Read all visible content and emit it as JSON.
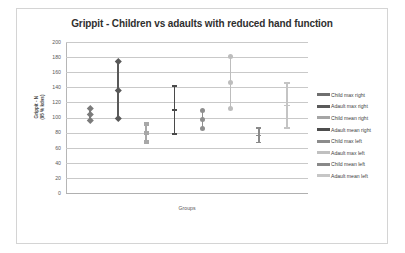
{
  "chart": {
    "title": "Grippit - Children vs adaults with reduced hand function",
    "xlabel": "Groups",
    "ylabel_line1": "Grippit - N",
    "ylabel_line2": "(95 % kdvs)"
  },
  "chart_data": {
    "type": "scatter",
    "title": "Grippit - Children vs adaults with reduced hand function",
    "xlabel": "Groups",
    "ylabel": "Grippit - N (95 % kdvs)",
    "ylim": [
      0,
      200
    ],
    "ytick_labels": [
      "0",
      "20",
      "40",
      "60",
      "80",
      "100",
      "120",
      "140",
      "160",
      "180",
      "200"
    ],
    "ytick_values": [
      0,
      20,
      40,
      60,
      80,
      100,
      120,
      140,
      160,
      180,
      200
    ],
    "grid": true,
    "legend_position": "right",
    "series": [
      {
        "name": "Child max right",
        "color": "#7b7b7b",
        "marker": "diamond",
        "x": 1,
        "mean": 104,
        "low": 96,
        "high": 112
      },
      {
        "name": "Adault max right",
        "color": "#595959",
        "marker": "triangle",
        "x": 2,
        "mean": 136,
        "low": 99,
        "high": 175
      },
      {
        "name": "Child mean right",
        "color": "#a8a8a8",
        "marker": "square",
        "x": 3,
        "mean": 80,
        "low": 68,
        "high": 91
      },
      {
        "name": "Adault mean right",
        "color": "#4a4a4a",
        "marker": "cross",
        "x": 4,
        "mean": 110,
        "low": 78,
        "high": 142
      },
      {
        "name": "Child max left",
        "color": "#8f8f8f",
        "marker": "dot",
        "x": 5,
        "mean": 97,
        "low": 86,
        "high": 109
      },
      {
        "name": "Adault max left",
        "color": "#bdbdbd",
        "marker": "circle",
        "x": 6,
        "mean": 146,
        "low": 112,
        "high": 181
      },
      {
        "name": "Child mean left",
        "color": "#8a8a8a",
        "marker": "line",
        "x": 7,
        "mean": 76,
        "low": 67,
        "high": 86
      },
      {
        "name": "Adault mean left",
        "color": "#c4c4c4",
        "marker": "line",
        "x": 8,
        "mean": 116,
        "low": 86,
        "high": 146
      }
    ]
  },
  "legend": {
    "items": [
      {
        "label": "Child max right",
        "color": "#6f6f6f"
      },
      {
        "label": "Adault max right",
        "color": "#5a5a5a"
      },
      {
        "label": "Child mean right",
        "color": "#a5a5a5"
      },
      {
        "label": "Adault mean right",
        "color": "#4d4d4d"
      },
      {
        "label": "Child max left",
        "color": "#8c8c8c"
      },
      {
        "label": "Adault max left",
        "color": "#c0c0c0"
      },
      {
        "label": "Child mean left",
        "color": "#898989"
      },
      {
        "label": "Adault mean left",
        "color": "#c6c6c6"
      }
    ]
  }
}
